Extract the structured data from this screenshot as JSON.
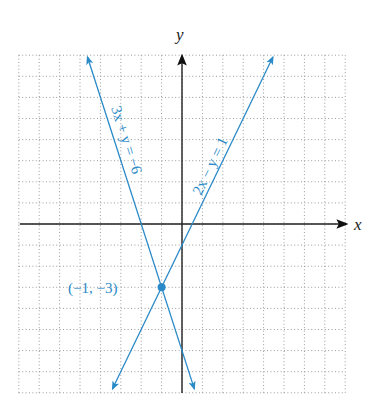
{
  "chart_data": {
    "type": "line",
    "title": "",
    "xlabel": "x",
    "ylabel": "y",
    "xlim": [
      -8,
      8
    ],
    "ylim": [
      -8,
      8
    ],
    "grid": true,
    "grid_step": 1,
    "series": [
      {
        "name": "3x + y = −6",
        "equation": "y = -3x - 6",
        "slope": -3,
        "intercept": -6,
        "points": [
          [
            -4.63,
            7.9
          ],
          [
            0.6,
            -7.8
          ]
        ],
        "label": "3x + y = −6",
        "color": "#2a8ac8"
      },
      {
        "name": "2x − y = 1",
        "equation": "y = 2x - 1",
        "slope": 2,
        "intercept": -1,
        "points": [
          [
            4.45,
            7.9
          ],
          [
            -3.4,
            -7.8
          ]
        ],
        "label": "2x − y = 1",
        "color": "#2a8ac8"
      }
    ],
    "annotations": [
      {
        "type": "point",
        "x": -1,
        "y": -3,
        "label": "(−1, −3)"
      }
    ]
  },
  "labels": {
    "x_axis": "x",
    "y_axis": "y",
    "line1": "3x + y = −6",
    "line2": "2x − y = 1",
    "intersection": "(−1, −3)"
  },
  "colors": {
    "line": "#2a8ac8",
    "axis": "#222222",
    "grid": "#9a9a9a"
  }
}
